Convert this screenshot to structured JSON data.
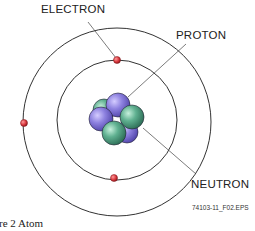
{
  "diagram": {
    "labels": {
      "electron": "ELECTRON",
      "proton": "PROTON",
      "neutron": "NEUTRON"
    },
    "figure_code": "74103-11_F02.EPS",
    "caption": "re 2  Atom",
    "colors": {
      "electron": "#d9383e",
      "proton": "#8a7fd6",
      "neutron": "#5fa88a",
      "orbit": "#333333"
    },
    "orbits": 2,
    "electrons": 3,
    "protons": 3,
    "neutrons": 3
  }
}
